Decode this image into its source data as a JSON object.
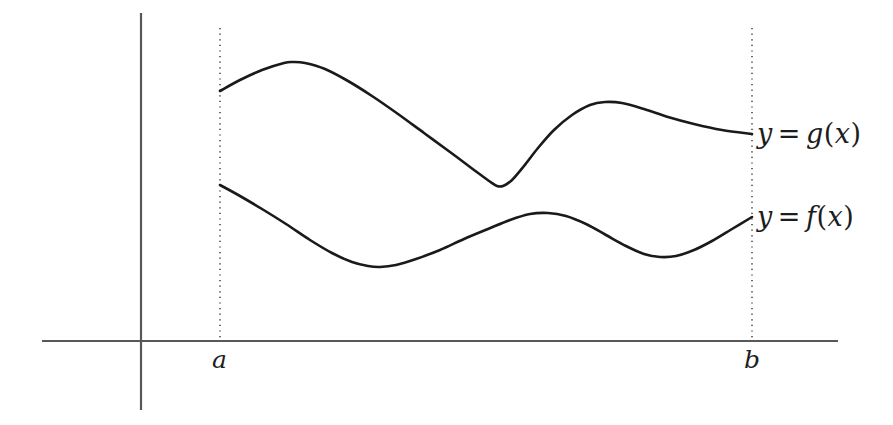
{
  "figure": {
    "kind": "area-between-curves-diagram",
    "background_color": "#ffffff",
    "width": 893,
    "height": 425
  },
  "axes": {
    "axis_color": "#58585a",
    "x_axis": {
      "name": "x-axis",
      "y": 341,
      "x_start": 42,
      "x_end": 838
    },
    "y_axis": {
      "name": "y-axis",
      "x": 141,
      "y_start": 13,
      "y_end": 410
    }
  },
  "guides": {
    "line_color": "#6a6a6c",
    "style": "dotted",
    "left": {
      "label": "a",
      "x": 220,
      "y_top": 28,
      "y_bottom": 341
    },
    "right": {
      "label": "b",
      "x": 752,
      "y_top": 28,
      "y_bottom": 341
    }
  },
  "tick_labels": {
    "a": "a",
    "b": "b"
  },
  "labels": {
    "upper_curve": {
      "y": "y",
      "equals": "=",
      "fn": "g",
      "open": "(",
      "arg": "x",
      "close": ")"
    },
    "lower_curve": {
      "y": "y",
      "equals": "=",
      "fn": "f",
      "open": "(",
      "arg": "x",
      "close": ")"
    }
  },
  "chart_data": {
    "type": "line",
    "title": "",
    "xlabel": "",
    "ylabel": "",
    "grid": false,
    "legend_position": "right-of-curve-endpoints",
    "axis_note": "screen pixel coordinates; y increases downward",
    "xlim": [
      42,
      838
    ],
    "ylim": [
      410,
      13
    ],
    "domain_markers": {
      "a": 220,
      "b": 752
    },
    "series": [
      {
        "name": "y = g(x)",
        "role": "upper-curve",
        "color": "#1a1a1a",
        "points": [
          [
            220,
            91
          ],
          [
            240,
            80
          ],
          [
            262,
            70
          ],
          [
            284,
            63
          ],
          [
            293,
            62
          ],
          [
            305,
            63
          ],
          [
            325,
            69
          ],
          [
            348,
            81
          ],
          [
            372,
            96
          ],
          [
            398,
            114
          ],
          [
            424,
            133
          ],
          [
            450,
            152
          ],
          [
            474,
            170
          ],
          [
            489,
            181
          ],
          [
            497,
            186
          ],
          [
            503,
            186
          ],
          [
            512,
            180
          ],
          [
            524,
            166
          ],
          [
            538,
            148
          ],
          [
            554,
            130
          ],
          [
            572,
            115
          ],
          [
            590,
            105
          ],
          [
            605,
            102
          ],
          [
            622,
            103
          ],
          [
            644,
            109
          ],
          [
            668,
            117
          ],
          [
            694,
            124
          ],
          [
            722,
            130
          ],
          [
            752,
            134
          ]
        ]
      },
      {
        "name": "y = f(x)",
        "role": "lower-curve",
        "color": "#1a1a1a",
        "points": [
          [
            220,
            185
          ],
          [
            240,
            196
          ],
          [
            262,
            209
          ],
          [
            286,
            224
          ],
          [
            310,
            240
          ],
          [
            332,
            253
          ],
          [
            352,
            262
          ],
          [
            368,
            266
          ],
          [
            380,
            267
          ],
          [
            396,
            265
          ],
          [
            416,
            259
          ],
          [
            440,
            250
          ],
          [
            464,
            239
          ],
          [
            488,
            229
          ],
          [
            510,
            220
          ],
          [
            530,
            214
          ],
          [
            548,
            213
          ],
          [
            566,
            216
          ],
          [
            586,
            224
          ],
          [
            606,
            235
          ],
          [
            626,
            246
          ],
          [
            644,
            254
          ],
          [
            660,
            257
          ],
          [
            676,
            256
          ],
          [
            694,
            250
          ],
          [
            712,
            241
          ],
          [
            732,
            229
          ],
          [
            752,
            217
          ]
        ]
      }
    ]
  }
}
